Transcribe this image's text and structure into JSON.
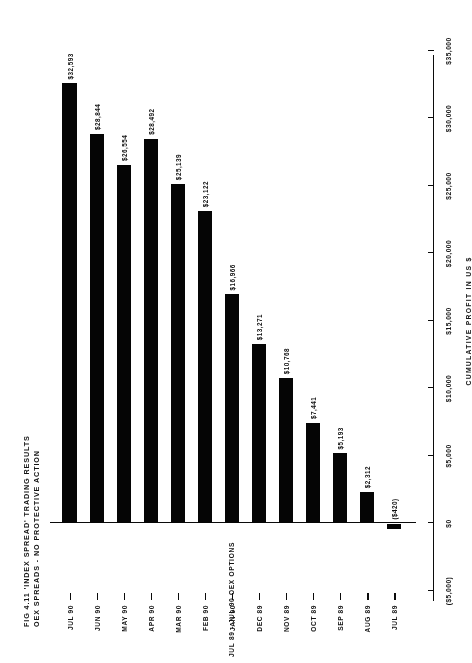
{
  "figure": {
    "title_lines": [
      "FIG 4.11 'INDEX SPREAD' TRADING RESULTS",
      "OEX SPREADS - NO PROTECTIVE ACTION"
    ],
    "period_caption": "JUL 89 - JUL 90 OEX OPTIONS"
  },
  "chart_data": {
    "type": "bar",
    "orientation": "horizontal",
    "title": "FIG 4.11 'INDEX SPREAD' TRADING RESULTS OEX SPREADS - NO PROTECTIVE ACTION",
    "xlabel": "CUMULATIVE PROFIT IN US $",
    "ylabel": "",
    "categories": [
      "JUL 89",
      "AUG 89",
      "SEP 89",
      "OCT 89",
      "NOV 89",
      "DEC 89",
      "JAN 90",
      "FEB 90",
      "MAR 90",
      "APR 90",
      "MAY 90",
      "JUN 90",
      "JUL 90"
    ],
    "values": [
      -420,
      2312,
      5193,
      7441,
      10768,
      13271,
      16966,
      23122,
      25139,
      28492,
      26554,
      28844,
      32593
    ],
    "value_labels": [
      "($420)",
      "$2,312",
      "$5,193",
      "$7,441",
      "$10,768",
      "$13,271",
      "$16,966",
      "$23,122",
      "$25,139",
      "$28,492",
      "$26,554",
      "$28,844",
      "$32,593"
    ],
    "xlim": [
      -5000,
      35000
    ],
    "tick_values": [
      -5000,
      0,
      5000,
      10000,
      15000,
      20000,
      25000,
      30000,
      35000
    ],
    "tick_labels": [
      "($5,000)",
      "$0",
      "$5,000",
      "$10,000",
      "$15,000",
      "$20,000",
      "$25,000",
      "$30,000",
      "$35,000"
    ],
    "grid": false,
    "legend": false,
    "bar_color": "#0b0b0b",
    "axis_color": "#111111"
  }
}
